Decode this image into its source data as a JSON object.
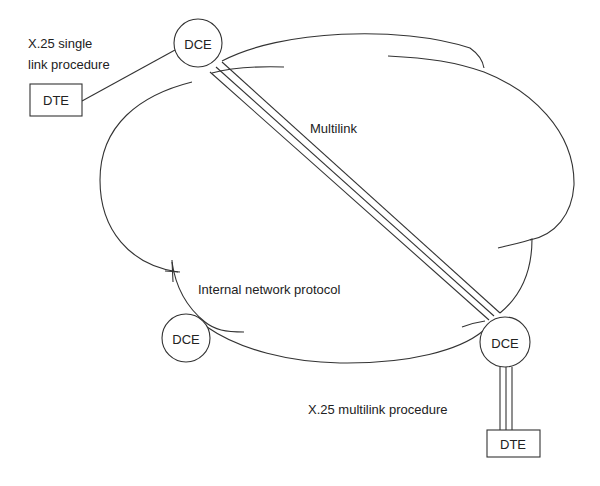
{
  "diagram": {
    "labels": {
      "single_link_line1": "X.25 single",
      "single_link_line2": "link procedure",
      "multilink": "Multilink",
      "internal_protocol": "Internal network protocol",
      "multilink_procedure": "X.25 multilink procedure"
    },
    "nodes": {
      "dce_top": "DCE",
      "dce_bottom_left": "DCE",
      "dce_bottom_right": "DCE",
      "dte_top": "DTE",
      "dte_bottom": "DTE"
    },
    "colors": {
      "line": "#333333",
      "text": "#222222",
      "background": "#ffffff"
    }
  }
}
